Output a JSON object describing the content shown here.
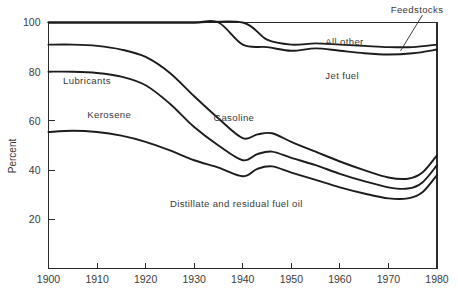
{
  "chart_data": {
    "type": "area",
    "title": "",
    "subtitle": "",
    "xlabel": "",
    "ylabel": "Percent",
    "xlim": [
      1900,
      1980
    ],
    "ylim": [
      0,
      100
    ],
    "grid": false,
    "legend_position": "inline-annotations",
    "stacked": true,
    "note": "Cumulative percentage shares of U.S. petroleum product output, boundary lines only (no fills). Each boundary is the running cumulative top of the stack from the bottom category upward.",
    "x_ticks": [
      1900,
      1910,
      1920,
      1930,
      1940,
      1950,
      1960,
      1970,
      1980
    ],
    "x_ticklabels": [
      "1900",
      "1910",
      "1920",
      "1930",
      "1940",
      "1950",
      "1960",
      "1970",
      "1980"
    ],
    "y_ticks": [
      20,
      40,
      60,
      80,
      100
    ],
    "y_ticklabels": [
      "20",
      "40",
      "60",
      "80",
      "100"
    ],
    "series": [
      {
        "name": "Distillate and residual fuel oil",
        "label": "Distillate and residual fuel oil",
        "label_x": 1925,
        "label_y": 25,
        "cumulative_x": [
          1900,
          1905,
          1910,
          1915,
          1920,
          1925,
          1930,
          1935,
          1940,
          1943,
          1946,
          1950,
          1955,
          1960,
          1965,
          1970,
          1974,
          1977,
          1980
        ],
        "cumulative_values": [
          55.5,
          56,
          55.5,
          54,
          51.5,
          48,
          44,
          41,
          37.5,
          40.5,
          41.5,
          39,
          36,
          33,
          30.5,
          28.5,
          28.5,
          31,
          38
        ]
      },
      {
        "name": "Gasoline",
        "label": "Gasoline",
        "label_x": 1934,
        "label_y": 60,
        "cumulative_x": [
          1900,
          1905,
          1910,
          1915,
          1920,
          1925,
          1930,
          1935,
          1940,
          1943,
          1946,
          1950,
          1955,
          1960,
          1965,
          1970,
          1974,
          1977,
          1980
        ],
        "cumulative_values": [
          80,
          80,
          79.5,
          78,
          74.5,
          67,
          57.5,
          50,
          44,
          46.5,
          47.5,
          45,
          42,
          38.5,
          35.5,
          33,
          32.5,
          35,
          42
        ]
      },
      {
        "name": "Jet fuel",
        "label": "Jet fuel",
        "label_x": 1957,
        "label_y": 77,
        "cumulative_x": [
          1900,
          1905,
          1910,
          1915,
          1920,
          1925,
          1930,
          1935,
          1940,
          1943,
          1946,
          1950,
          1955,
          1960,
          1965,
          1970,
          1974,
          1977,
          1980
        ],
        "cumulative_values": [
          91,
          91,
          90.5,
          89,
          86,
          79.5,
          70,
          61,
          53,
          54.5,
          55,
          51.5,
          47.5,
          43.5,
          40,
          37,
          36.5,
          39,
          46
        ]
      },
      {
        "name": "Kerosene",
        "label": "Kerosene",
        "label_x": 1908,
        "label_y": 61,
        "cumulative_x": [
          1900,
          1910,
          1920,
          1930,
          1935,
          1940,
          1945,
          1950,
          1955,
          1960,
          1965,
          1970,
          1975,
          1980
        ],
        "cumulative_values": [
          100,
          100,
          100,
          100,
          100,
          91,
          90,
          88.5,
          89.5,
          88.5,
          87.5,
          87,
          87.5,
          89
        ]
      },
      {
        "name": "Lubricants",
        "label": "Lubricants",
        "label_x": 1903,
        "label_y": 75,
        "cumulative_x": [
          1900,
          1910,
          1920,
          1930,
          1940,
          1945,
          1950,
          1955,
          1960,
          1965,
          1970,
          1975,
          1980
        ],
        "cumulative_values": [
          100,
          100,
          100,
          100,
          100,
          93,
          91,
          91.5,
          91,
          90.5,
          90,
          90,
          91
        ]
      },
      {
        "name": "All other",
        "label": "All other",
        "label_x": 1957,
        "label_y": 91,
        "cumulative_x": [
          1900,
          1980
        ],
        "cumulative_values": [
          100,
          100
        ]
      },
      {
        "name": "Feedstocks",
        "label": "Feedstocks",
        "label_x": 1978,
        "label_y": 104,
        "leader_from": [
          1977,
          103
        ],
        "leader_to": [
          1972.5,
          88.5
        ]
      }
    ],
    "annotations": [
      {
        "text": "Lubricants",
        "x": 1903,
        "y": 75
      },
      {
        "text": "Kerosene",
        "x": 1908,
        "y": 61
      },
      {
        "text": "Gasoline",
        "x": 1934,
        "y": 60
      },
      {
        "text": "Distillate and residual fuel oil",
        "x": 1925,
        "y": 25
      },
      {
        "text": "All other",
        "x": 1957,
        "y": 91
      },
      {
        "text": "Jet fuel",
        "x": 1957,
        "y": 77
      },
      {
        "text": "Feedstocks",
        "x": 1978,
        "y": 104
      }
    ],
    "colors": {
      "line": "#1c1c1c",
      "axis": "#2b2b2b",
      "text": "#3a3a3a",
      "background": "#ffffff"
    }
  },
  "axis": {
    "y_title": "Percent"
  }
}
